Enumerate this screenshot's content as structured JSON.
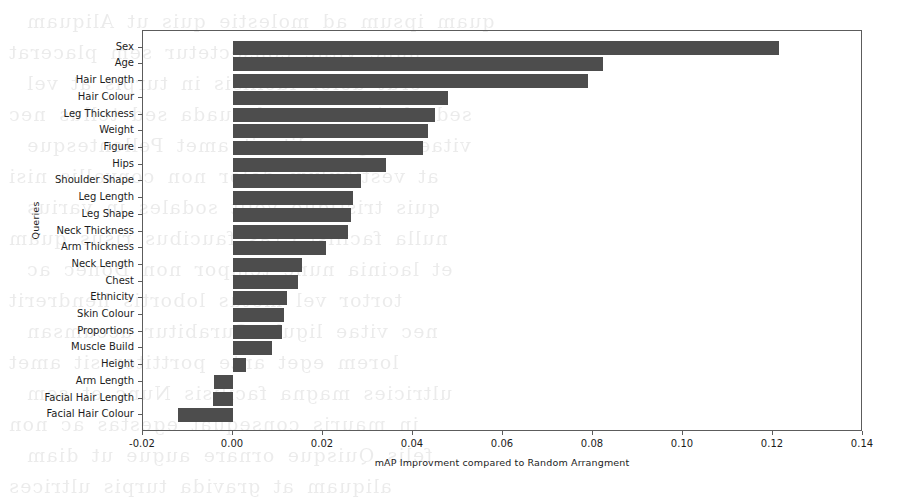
{
  "chart_data": {
    "type": "bar",
    "orientation": "horizontal",
    "title": "",
    "xlabel": "mAP Improvment compared to Random Arrangment",
    "ylabel": "Queries",
    "xlim": [
      -0.02,
      0.14
    ],
    "ylim": [
      0,
      22
    ],
    "grid": false,
    "legend": null,
    "bar_color": "#4d4d4d",
    "axis_color": "#5c5c5c",
    "background_color": "#ffffff",
    "xticks": [
      "-0.02",
      "0.00",
      "0.02",
      "0.04",
      "0.06",
      "0.08",
      "0.10",
      "0.12",
      "0.14"
    ],
    "xtick_values": [
      -0.02,
      0.0,
      0.02,
      0.04,
      0.06,
      0.08,
      0.1,
      0.12,
      0.14
    ],
    "categories": [
      "Sex",
      "Age",
      "Hair Length",
      "Hair Colour",
      "Leg Thickness",
      "Weight",
      "Figure",
      "Hips",
      "Shoulder Shape",
      "Leg Length",
      "Leg Shape",
      "Neck Thickness",
      "Arm Thickness",
      "Neck Length",
      "Chest",
      "Ethnicity",
      "Skin Colour",
      "Proportions",
      "Muscle Build",
      "Height",
      "Arm Length",
      "Facial Hair Length",
      "Facial Hair Colour"
    ],
    "values": [
      0.1213,
      0.0822,
      0.0789,
      0.0478,
      0.0449,
      0.0433,
      0.0422,
      0.034,
      0.0284,
      0.0267,
      0.0262,
      0.0256,
      0.0207,
      0.0153,
      0.0144,
      0.012,
      0.0113,
      0.0109,
      0.0087,
      0.0029,
      -0.0042,
      -0.0044,
      -0.0122
    ]
  },
  "page_bleed_through": [
    "quam ipsum ad molestie quis ut Aliquam",
    "nunc vitae consectetur sem placerat",
    "erat dolor facilisis in turpis at vel",
    "sed ultrices ut malesuada sed tellus nec",
    "vitae congue elit sit amet Pellentesque",
    "at vestibulum dolor non convallis nisi",
    "quis tristique velit sodales in varius",
    "nulla facilisi Cras faucibus risus quam",
    "et lacinia nunc tempor non Donec ac",
    "tortor vel metus lobortis hendrerit",
    "nec vitae ligula Curabitur accumsan",
    "lorem eget ante porttitor sit amet",
    "ultricies magna facilisis Nunc et sem",
    "in mauris consequat egestas ac non",
    "felis Quisque ornare augue ut diam",
    "aliquam at gravida turpis ultrices"
  ]
}
